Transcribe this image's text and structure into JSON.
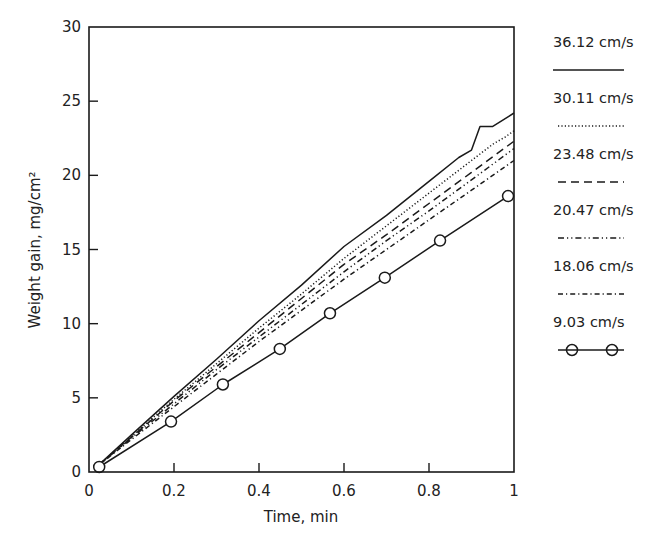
{
  "chart_data": {
    "type": "line",
    "title": "",
    "xlabel": "Time, min",
    "ylabel": "Weight gain, mg/cm²",
    "xlim": [
      0,
      1
    ],
    "ylim": [
      0,
      30
    ],
    "xticks": [
      "0",
      "0.2",
      "0.4",
      "0.6",
      "0.8",
      "1"
    ],
    "yticks": [
      "0",
      "5",
      "10",
      "15",
      "20",
      "25",
      "30"
    ],
    "grid": false,
    "legend_position": "right, outside plot",
    "series": [
      {
        "name": "36.12 cm/s",
        "style": "solid",
        "x": [
          0.02,
          0.1,
          0.2,
          0.3,
          0.4,
          0.5,
          0.6,
          0.7,
          0.8,
          0.87,
          0.9,
          0.92,
          0.95,
          1.0
        ],
        "y": [
          0.4,
          2.5,
          5.1,
          7.6,
          10.2,
          12.6,
          15.2,
          17.3,
          19.6,
          21.2,
          21.7,
          23.3,
          23.3,
          24.2
        ]
      },
      {
        "name": "30.11 cm/s",
        "style": "dotted",
        "x": [
          0.02,
          0.1,
          0.2,
          0.3,
          0.4,
          0.5,
          0.6,
          0.7,
          0.8,
          0.9,
          0.95,
          0.98,
          1.0
        ],
        "y": [
          0.4,
          2.4,
          4.9,
          7.3,
          9.7,
          12.0,
          14.4,
          16.6,
          18.8,
          21.0,
          22.1,
          22.6,
          23.0
        ]
      },
      {
        "name": "23.48 cm/s",
        "style": "dashed",
        "x": [
          0.02,
          0.1,
          0.2,
          0.3,
          0.4,
          0.5,
          0.6,
          0.7,
          0.8,
          0.9,
          1.0
        ],
        "y": [
          0.4,
          2.35,
          4.8,
          7.1,
          9.4,
          11.7,
          14.0,
          16.0,
          18.1,
          20.2,
          22.3
        ]
      },
      {
        "name": "20.47 cm/s",
        "style": "dash-dot-dot",
        "x": [
          0.02,
          0.1,
          0.2,
          0.3,
          0.4,
          0.5,
          0.6,
          0.7,
          0.8,
          0.9,
          1.0
        ],
        "y": [
          0.4,
          2.3,
          4.6,
          6.9,
          9.1,
          11.3,
          13.5,
          15.6,
          17.6,
          19.7,
          21.8
        ]
      },
      {
        "name": "18.06 cm/s",
        "style": "dash-dot",
        "x": [
          0.02,
          0.1,
          0.2,
          0.3,
          0.4,
          0.5,
          0.6,
          0.7,
          0.8,
          0.9,
          1.0
        ],
        "y": [
          0.4,
          2.2,
          4.4,
          6.6,
          8.8,
          10.9,
          13.0,
          15.0,
          17.0,
          19.0,
          21.0
        ]
      },
      {
        "name": "9.03 cm/s",
        "style": "solid with circle markers",
        "x": [
          0.024,
          0.193,
          0.315,
          0.449,
          0.567,
          0.696,
          0.826,
          0.986
        ],
        "y": [
          0.34,
          3.4,
          5.9,
          8.3,
          10.7,
          13.1,
          15.6,
          18.6
        ]
      }
    ]
  },
  "colors": {
    "ink": "#1a1a1a",
    "background": "#ffffff"
  }
}
